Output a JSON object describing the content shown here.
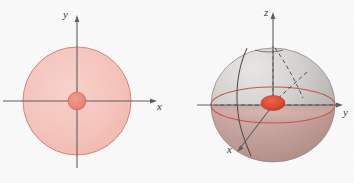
{
  "figure": {
    "background_color": "#fbfafa",
    "width": 354,
    "height": 183
  },
  "colors": {
    "disk_fill": "#f6c6bf",
    "disk_stroke": "#d98476",
    "center_dot_fill": "#ef8277",
    "center_dot_stroke": "#d9564a",
    "dome_upper": "#cfcccb",
    "dome_lower": "#c9a9a5",
    "equator_stroke": "#c9594c",
    "axis_stroke": "#5a5a5a",
    "dashed_stroke": "#4f4f4f",
    "hidden_curve_stroke": "#3f3f3f",
    "hot_spot_fill": "#e0442e"
  },
  "panels": [
    {
      "id": "panel-2d",
      "name": "disk-diagram",
      "caption": "",
      "axes": [
        {
          "name": "x-axis",
          "label": "x",
          "label_x": 160,
          "label_y": 107
        },
        {
          "name": "y-axis",
          "label": "y",
          "label_x": 68,
          "label_y": 16
        }
      ],
      "shapes": [
        {
          "name": "outer-disk",
          "kind": "circle",
          "cx": 77,
          "cy": 101,
          "r": 54
        },
        {
          "name": "center-dot",
          "kind": "circle",
          "cx": 77,
          "cy": 101,
          "r": 9
        }
      ]
    },
    {
      "id": "panel-3d",
      "name": "hemisphere-diagram",
      "caption": "",
      "axes": [
        {
          "name": "z-axis",
          "label": "z",
          "label_x": 90,
          "label_y": 14
        },
        {
          "name": "y-axis",
          "label": "y",
          "label_x": 166,
          "label_y": 114
        },
        {
          "name": "x-axis",
          "label": "x",
          "label_x": 54,
          "label_y": 152
        }
      ],
      "shapes": [
        {
          "name": "dome",
          "kind": "hemisphere",
          "cx": 96,
          "cy": 105,
          "rx": 62,
          "ry": 57
        },
        {
          "name": "equator-ellipse",
          "kind": "ellipse",
          "cx": 96,
          "cy": 105,
          "rx": 62,
          "ry": 18
        },
        {
          "name": "hot-spot",
          "kind": "ellipse",
          "cx": 96,
          "cy": 103,
          "rx": 12,
          "ry": 7
        }
      ]
    }
  ]
}
